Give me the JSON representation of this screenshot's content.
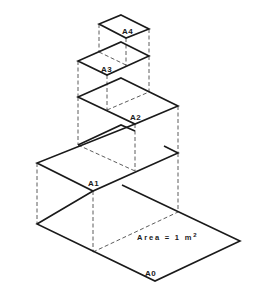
{
  "diagram": {
    "sheets": [
      {
        "id": "A0",
        "label": "A0"
      },
      {
        "id": "A1",
        "label": "A1"
      },
      {
        "id": "A2",
        "label": "A2"
      },
      {
        "id": "A3",
        "label": "A3"
      },
      {
        "id": "A4",
        "label": "A4"
      }
    ],
    "area_annotation": {
      "text": "Area  = 1 m",
      "superscript": "2"
    }
  },
  "caption": {
    "text": "",
    "clipped": true
  },
  "colors": {
    "line": "#1a1a1a",
    "background": "#ffffff"
  }
}
